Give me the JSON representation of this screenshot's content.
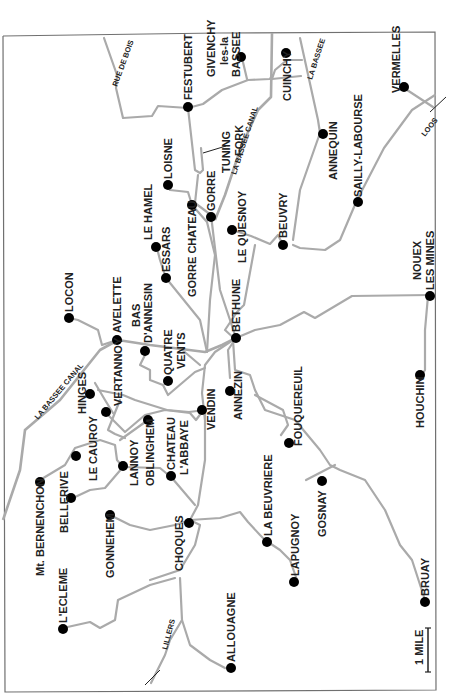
{
  "map": {
    "orientation": "rotated 90 degrees counter-clockwise",
    "scale_label": "1 MILE",
    "colors": {
      "road": "#aaaaaa",
      "frame": "#707070",
      "town": "#000000",
      "text": "#222222"
    },
    "road_labels": {
      "rue_de_bois": "RUE DE BOIS",
      "la_bassee_canal_top": "LA BASSEE CANAL",
      "la_bassee_canal_left": "LA BASSEE CANAL",
      "la_bassee_road": "LA BASSEE",
      "loos": "LOOS",
      "lillers": "LILLERS",
      "tuning_fork_1": "TUNING",
      "tuning_fork_2": "FORK"
    },
    "towns": {
      "festubert": "FESTUBERT",
      "givenchy_1": "GIVENCHY",
      "givenchy_2": "les-la",
      "givenchy_3": "BASSEE",
      "cuinchy": "CUINCHY",
      "vermelles": "VERMELLES",
      "annequin": "ANNEQUIN",
      "sailly": "SAILLY-LABOURSE",
      "loisne": "LOISNE",
      "gorre": "GORRE",
      "gorre_chateau": "GORRE CHATEAU",
      "le_quesnoy": "LE QUESNOY",
      "beuvry": "BEUVRY",
      "le_hamel": "LE HAMEL",
      "essars": "ESSARS",
      "noeux_1": "NOUEX",
      "noeux_2": "LES MINES",
      "bethune": "BETHUNE",
      "locon": "LOCON",
      "avelette": "AVELETTE",
      "bas_annesin_1": "BAS",
      "bas_annesin_2": "D'ANNESIN",
      "quatre_vents_1": "QUATRE",
      "quatre_vents_2": "VENTS",
      "hinges": "HINGES",
      "vertannoy": "VERTANNOY",
      "vendin": "VENDIN",
      "annezin": "ANNEZIN",
      "houchin": "HOUCHIN",
      "fouquereuil": "FOUQUEREUIL",
      "le_cauroy": "LE CAUROY",
      "lannoy": "LANNOY",
      "oblinghem": "OBLINGHEM",
      "chateau_abbaye_1": "CHATEAU",
      "chateau_abbaye_2": "L'ABBAYE",
      "bernenchon": "Mt. BERNENCHON",
      "bellerive": "BELLERIVE",
      "gonnehem": "GONNEHEM",
      "choques": "CHOQUES",
      "la_beuvriere": "LA BEUVRIERE",
      "lapugnoy": "LAPUGNOY",
      "gosnay": "GOSNAY",
      "lecleme": "L'ECLEME",
      "allouagne": "ALLOUAGNE",
      "bruay": "BRUAY"
    }
  }
}
